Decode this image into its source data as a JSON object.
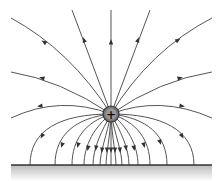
{
  "diagram": {
    "type": "electric-field-lines",
    "charge": {
      "symbol": "+",
      "cx": 111,
      "cy": 114,
      "r": 8,
      "fill": "#777777",
      "stroke": "#333333"
    },
    "ground": {
      "y": 165,
      "x1": 11,
      "x2": 212,
      "line_color": "#333333",
      "shade_top": "#bbbbbb",
      "shade_bottom": "#ffffff"
    },
    "colors": {
      "line": "#555555",
      "arrow": "#333333",
      "background": "#ffffff"
    },
    "upper_lines": [
      {
        "d": "M111,114 L111,10",
        "arrow": [
          111,
          42,
          270
        ]
      },
      {
        "d": "M111,114 L150,10",
        "arrow": [
          138,
          40,
          290
        ]
      },
      {
        "d": "M111,114 L72,10",
        "arrow": [
          84,
          40,
          250
        ]
      },
      {
        "d": "M111,114 Q150,50 212,18",
        "arrow": [
          178,
          40,
          328
        ]
      },
      {
        "d": "M111,114 Q70,50 11,18",
        "arrow": [
          44,
          42,
          212
        ]
      },
      {
        "d": "M111,114 Q160,80 212,72",
        "arrow": [
          180,
          78,
          345
        ]
      },
      {
        "d": "M111,114 Q60,80 11,72",
        "arrow": [
          42,
          78,
          195
        ]
      },
      {
        "d": "M111,114 Q160,95 212,118",
        "arrow": [
          182,
          106,
          10
        ]
      },
      {
        "d": "M111,114 Q60,95 11,118",
        "arrow": [
          40,
          106,
          170
        ]
      }
    ],
    "lower_lines": [
      {
        "d": "M111,114 C60,114 30,130 30,165",
        "arrow": [
          42,
          136,
          120
        ]
      },
      {
        "d": "M111,114 C75,118 55,135 55,165",
        "arrow": [
          62,
          145,
          110
        ]
      },
      {
        "d": "M111,114 C85,122 72,140 72,165",
        "arrow": [
          78,
          145,
          105
        ]
      },
      {
        "d": "M111,114 C95,126 84,145 84,165",
        "arrow": [
          88,
          148,
          100
        ]
      },
      {
        "d": "M111,114 C102,130 93,148 93,165",
        "arrow": [
          96,
          148,
          98
        ]
      },
      {
        "d": "M111,114 C107,134 100,152 100,165",
        "arrow": [
          102,
          150,
          95
        ]
      },
      {
        "d": "M111,114 C110,138 106,155 106,165",
        "arrow": [
          107,
          150,
          93
        ]
      },
      {
        "d": "M111,114 L111,165",
        "arrow": [
          111,
          150,
          90
        ]
      },
      {
        "d": "M111,114 C112,138 116,155 116,165",
        "arrow": [
          115,
          150,
          87
        ]
      },
      {
        "d": "M111,114 C115,134 122,152 122,165",
        "arrow": [
          120,
          150,
          85
        ]
      },
      {
        "d": "M111,114 C120,130 129,148 129,165",
        "arrow": [
          126,
          148,
          82
        ]
      },
      {
        "d": "M111,114 C127,126 138,145 138,165",
        "arrow": [
          134,
          148,
          80
        ]
      },
      {
        "d": "M111,114 C137,122 150,140 150,165",
        "arrow": [
          144,
          145,
          75
        ]
      },
      {
        "d": "M111,114 C147,118 167,135 167,165",
        "arrow": [
          160,
          142,
          70
        ]
      },
      {
        "d": "M111,114 C162,114 194,130 194,165",
        "arrow": [
          182,
          136,
          60
        ]
      }
    ]
  }
}
